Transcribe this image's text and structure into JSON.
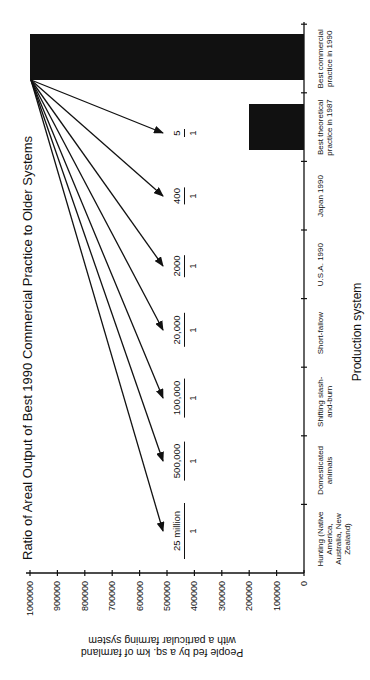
{
  "chart_data": {
    "type": "bar",
    "title": "Ratio of Areal Output of Best 1990 Commercial Practice to Older Systems",
    "xlabel": "Production system",
    "ylabel": "People fed by a sq. km of farmland with a particular farming system",
    "ylim": [
      0,
      1000000
    ],
    "yticks": [
      0,
      100000,
      200000,
      300000,
      400000,
      500000,
      600000,
      700000,
      800000,
      900000,
      1000000
    ],
    "ytick_labels": [
      "0",
      "100000",
      "200000",
      "300000",
      "400000",
      "500000",
      "600000",
      "700000",
      "800000",
      "900000",
      "1000000"
    ],
    "categories": [
      "Hunting (Native America, Australia, New Zealand)",
      "Domesticated animals",
      "Shifting slash-and-burn",
      "Short-fallow",
      "U.S.A. 1990",
      "Japan 1990",
      "Best theoretical practice in 1987",
      "Best commercial practice in 1990"
    ],
    "values": [
      0.04,
      2,
      10,
      50,
      500,
      2500,
      200000,
      1000000
    ],
    "annotations": [
      {
        "category": "Hunting (Native America, Australia, New Zealand)",
        "ratio": "25 million : 1"
      },
      {
        "category": "Domesticated animals",
        "ratio": "500,000 : 1"
      },
      {
        "category": "Shifting slash-and-burn",
        "ratio": "100,000 : 1"
      },
      {
        "category": "Short-fallow",
        "ratio": "20,000 : 1"
      },
      {
        "category": "U.S.A. 1990",
        "ratio": "2000 : 1"
      },
      {
        "category": "Japan 1990",
        "ratio": "400 : 1"
      },
      {
        "category": "Best theoretical practice in 1987",
        "ratio": "5 : 1"
      }
    ],
    "orientation": "figure rotated 90 degrees counter-clockwise",
    "grid": false,
    "legend": "none",
    "bar_color": "#111111"
  },
  "labels": {
    "title": "Ratio of Areal Output of Best 1990 Commercial Practice to Older Systems",
    "ytitle_line1": "People fed by a sq. km of farmland",
    "ytitle_line2": "with a particular farming  system",
    "xtitle": "Production system",
    "yticks": [
      "1000000",
      "900000",
      "800000",
      "700000",
      "600000",
      "500000",
      "400000",
      "300000",
      "200000",
      "100000",
      "0"
    ],
    "categories": [
      "Hunting (Native America, Australia, New Zealand)",
      "Domesticated animals",
      "Shifting slash-and-burn",
      "Short-fallow",
      "U.S.A. 1990",
      "Japan 1990",
      "Best theoretical practice in 1987",
      "Best commercial practice in 1990"
    ],
    "ratios": [
      {
        "num": "25 million",
        "den": "1"
      },
      {
        "num": "500,000",
        "den": "1"
      },
      {
        "num": "100,000",
        "den": "1"
      },
      {
        "num": "20,000",
        "den": "1"
      },
      {
        "num": "2000",
        "den": "1"
      },
      {
        "num": "400",
        "den": "1"
      },
      {
        "num": "5",
        "den": "1"
      }
    ]
  }
}
